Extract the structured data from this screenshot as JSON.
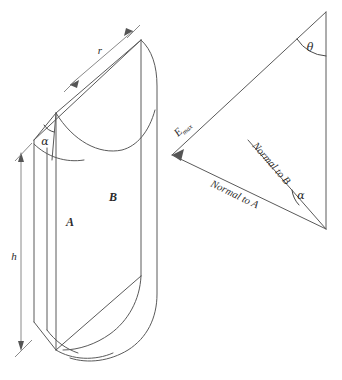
{
  "figure": {
    "background_color": "#ffffff",
    "line_color": "#5a5a5a",
    "dim_line_color": "#8a8a8a",
    "text_color": "#2b2b2b"
  },
  "cylinder_diagram": {
    "name": "cylinder-wedge",
    "labels": {
      "radius": "r",
      "height": "h",
      "apex_angle": "α",
      "face_a": "A",
      "face_b": "B"
    }
  },
  "triangle_diagram": {
    "name": "vector-triangle",
    "labels": {
      "theta": "θ",
      "alpha": "α",
      "e_max_base": "E",
      "e_max_sub": "max",
      "normal_to_a": "Normal to A",
      "normal_to_b": "Normal to B"
    }
  }
}
